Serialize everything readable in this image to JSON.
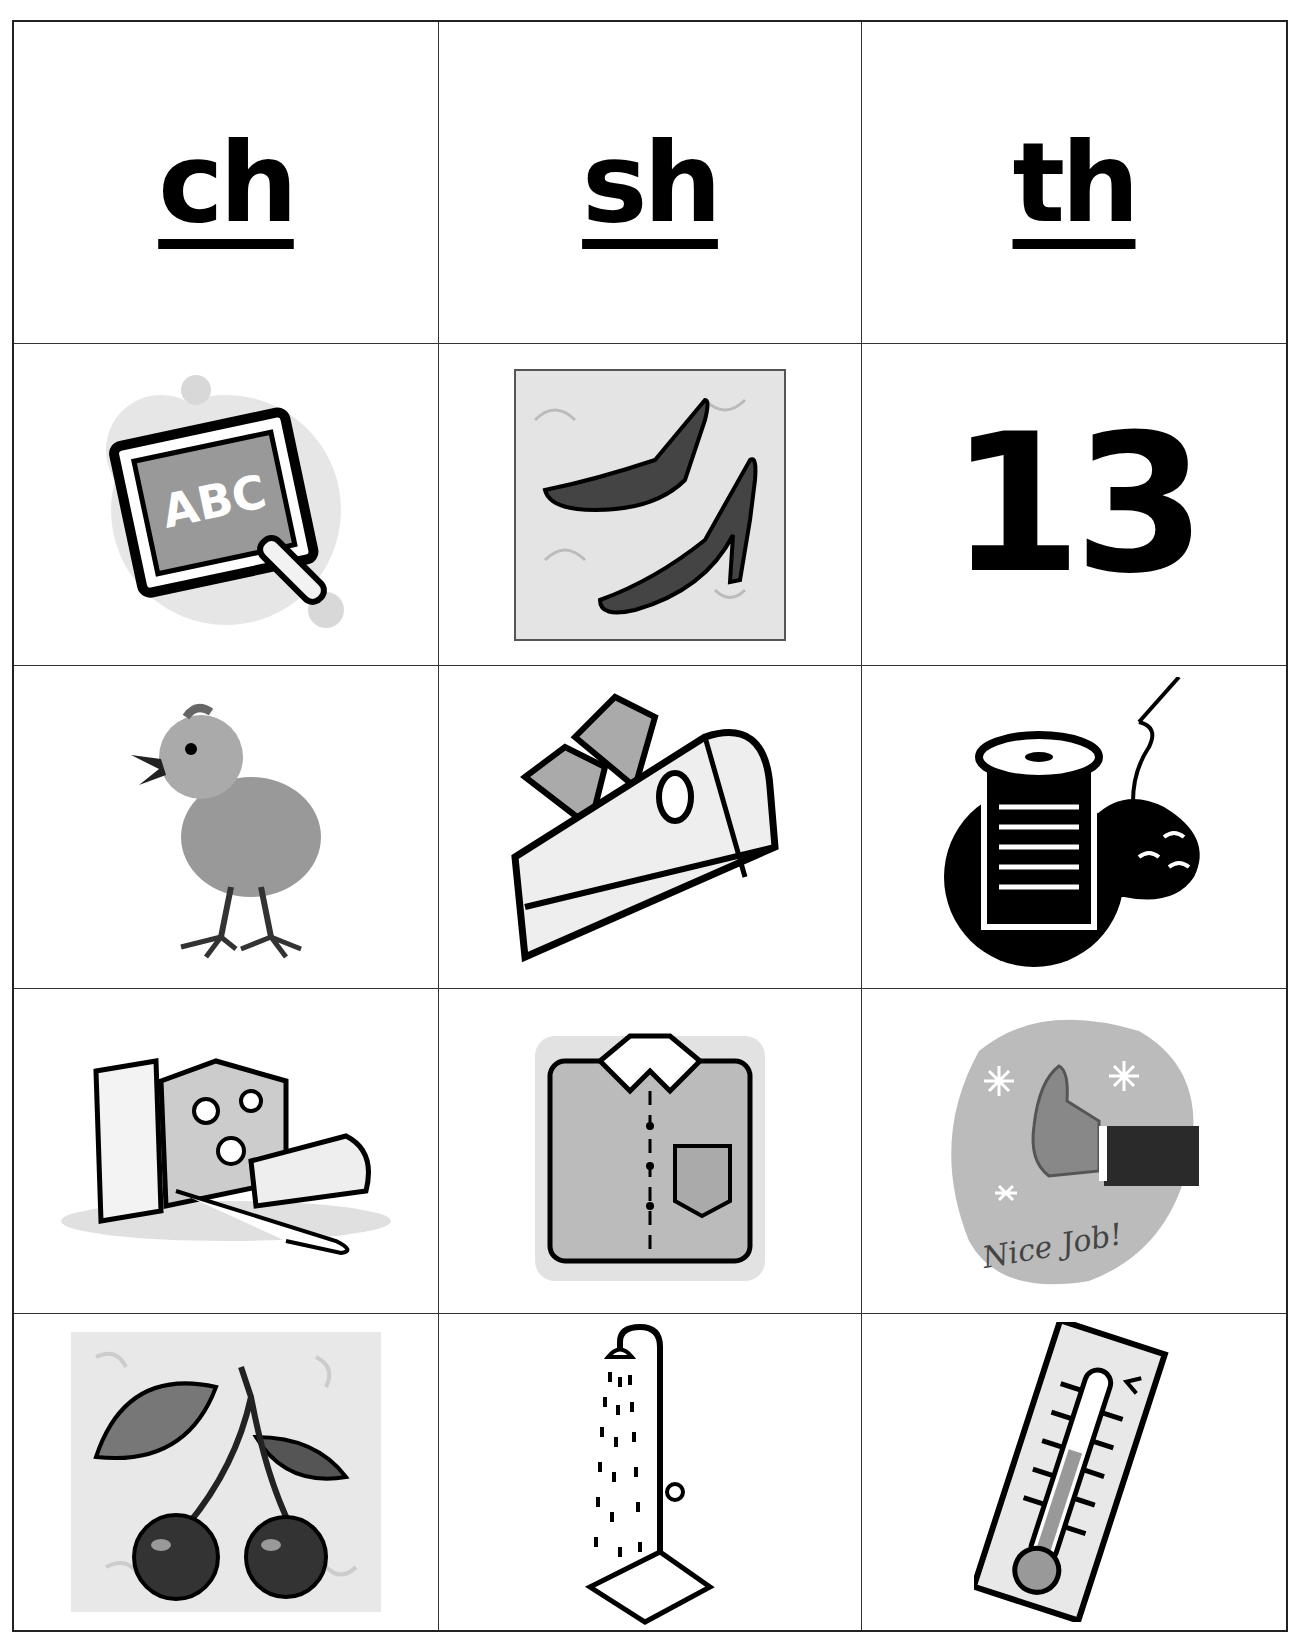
{
  "worksheet": {
    "headers": [
      {
        "label": "ch"
      },
      {
        "label": "sh"
      },
      {
        "label": "th"
      }
    ],
    "rows": [
      [
        {
          "picture": "chalkboard",
          "caption": "ABC"
        },
        {
          "picture": "shoes"
        },
        {
          "picture": "thirteen",
          "caption": "13"
        }
      ],
      [
        {
          "picture": "chick"
        },
        {
          "picture": "ship"
        },
        {
          "picture": "thread"
        }
      ],
      [
        {
          "picture": "cheese"
        },
        {
          "picture": "shirt"
        },
        {
          "picture": "thumbs-up",
          "caption": "Nice Job!"
        }
      ],
      [
        {
          "picture": "cherries"
        },
        {
          "picture": "shower"
        },
        {
          "picture": "thermometer"
        }
      ]
    ]
  },
  "colors": {
    "ink": "#000000",
    "grid_line": "#333333",
    "light_gray": "#d9d9d9",
    "mid_gray": "#8a8a8a",
    "dark_gray": "#4a4a4a"
  }
}
